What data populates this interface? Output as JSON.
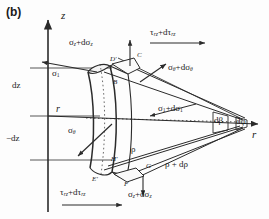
{
  "figure": {
    "panel_label": "(b)",
    "caption_kind": "stress element in cylindrical coordinates"
  },
  "axes": {
    "vertical_label": "z",
    "horizontal_label": "r",
    "dz_upper": "dz",
    "dz_lower": "−dz"
  },
  "stresses": {
    "sigma_z_top": {
      "base": "σ",
      "sub": "z",
      "full": "σz + dσz"
    },
    "sigma_z_bottom": {
      "base": "σ",
      "sub": "z",
      "full": "σz + dσz"
    },
    "tau_rz_top": {
      "base": "τ",
      "sub": "rz",
      "full": "τrz + dτrz"
    },
    "tau_rz_bottom": {
      "base": "τ",
      "sub": "rz",
      "full": "τrz + dτrz"
    },
    "sigma_theta_right": {
      "base": "σ",
      "sub": "θ",
      "full": "σθ + dσθ"
    },
    "sigma_theta_left": {
      "base": "σ",
      "sub": "θ",
      "full": "σθ"
    },
    "sigma_1_left": {
      "base": "σ",
      "sub": "1",
      "full": "σ1"
    },
    "sigma_1_right": {
      "base": "σ",
      "sub": "1",
      "full": "σ1 + dσ1"
    }
  },
  "radii": {
    "r": "r",
    "rho": "ρ",
    "rho_plus_drho": "ρ + dρ"
  },
  "angles": {
    "d_beta": "dβ",
    "d_phi": "dφ"
  },
  "vertices": {
    "B": "B",
    "C": "C",
    "D_prime": "D'",
    "E_prime": "E'",
    "F": "F",
    "G": "G",
    "H_prime": "H'"
  },
  "symbols": {
    "d_prefix": "d",
    "plus": "+"
  },
  "colors": {
    "line": "#2b2b2b",
    "text": "#1a1a1a",
    "background": "#fdfdfd"
  }
}
